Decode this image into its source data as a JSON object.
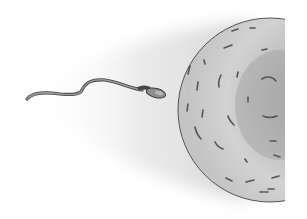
{
  "illustration": {
    "description": "Sperm cell swimming toward an egg cell (ovum), grayscale pencil-style illustration",
    "subjects": [
      "sperm",
      "egg"
    ],
    "colors": {
      "background": "#ffffff",
      "motion_shadow": "#d8d8d8",
      "egg_fill": "#cfcfcf",
      "egg_dark": "#a9a9a9",
      "egg_outline": "#555555",
      "sperm_body": "#8a8a8a",
      "sperm_outline": "#444444",
      "marks": "#5a5a5a"
    }
  }
}
